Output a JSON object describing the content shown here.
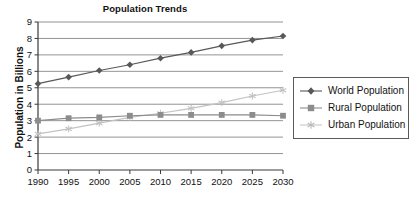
{
  "chart_data": {
    "type": "line",
    "title": "Population Trends",
    "xlabel": "",
    "ylabel": "Population in Billions",
    "x": [
      1990,
      1995,
      2000,
      2005,
      2010,
      2015,
      2020,
      2025,
      2030
    ],
    "xtick_labels": [
      "1990",
      "1995",
      "2000",
      "2005",
      "2010",
      "2015",
      "2020",
      "2025",
      "2030"
    ],
    "ytick_labels": [
      "0",
      "1",
      "2",
      "3",
      "4",
      "5",
      "6",
      "7",
      "8",
      "9"
    ],
    "ylim": [
      0,
      9
    ],
    "xlim": [
      1990,
      2030
    ],
    "grid": "horizontal",
    "legend_position": "right",
    "series": [
      {
        "name": "World Population",
        "marker": "diamond",
        "color": "#585858",
        "values": [
          5.25,
          5.65,
          6.05,
          6.4,
          6.8,
          7.15,
          7.55,
          7.9,
          8.15
        ]
      },
      {
        "name": "Rural Population",
        "marker": "square",
        "color": "#8c8c8c",
        "values": [
          3.0,
          3.15,
          3.2,
          3.3,
          3.35,
          3.35,
          3.35,
          3.35,
          3.3
        ]
      },
      {
        "name": "Urban Population",
        "marker": "star",
        "color": "#c2c2c2",
        "values": [
          2.2,
          2.5,
          2.85,
          3.2,
          3.45,
          3.75,
          4.1,
          4.5,
          4.85
        ]
      }
    ]
  },
  "legend": {
    "entries": [
      {
        "label": "World Population"
      },
      {
        "label": "Rural Population"
      },
      {
        "label": "Urban Population"
      }
    ]
  },
  "colors": {
    "axis": "#3a3a3a",
    "grid": "#777777",
    "background": "#ffffff"
  }
}
